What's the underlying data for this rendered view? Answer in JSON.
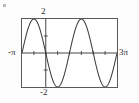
{
  "figure": {
    "title": "",
    "frame": {
      "border_color": "#5a5a5a",
      "background": "#ffffff"
    },
    "labels": {
      "y_max": "2",
      "y_min": "-2",
      "x_min": "-π",
      "x_max": "3π"
    }
  },
  "chart_data": {
    "type": "line",
    "title": "",
    "xlabel": "",
    "ylabel": "",
    "xlim": [
      -3.14159265,
      9.42477796
    ],
    "ylim": [
      -2,
      2
    ],
    "grid": false,
    "legend": null,
    "curve_color": "#3a3a3a",
    "axis_color": "#2b2b2b",
    "x_tick_labels": [
      "-π",
      "3π"
    ],
    "y_tick_labels": [
      "-2",
      "2"
    ],
    "x_ticks": [
      -3.14159265,
      -1.57079633,
      0,
      1.57079633,
      3.14159265,
      4.71238898,
      6.28318531,
      7.85398163,
      9.42477796
    ],
    "y_ticks": [
      -2,
      -1,
      0,
      1,
      2
    ],
    "series": [
      {
        "name": "y = -2 sin(x)",
        "amplitude": 2,
        "period": 6.28318531,
        "x": [
          -3.14159265,
          -2.74889357,
          -2.35619449,
          -1.96349541,
          -1.57079633,
          -1.17809725,
          -0.78539816,
          -0.39269908,
          0,
          0.39269908,
          0.78539816,
          1.17809725,
          1.57079633,
          1.96349541,
          2.35619449,
          2.74889357,
          3.14159265,
          3.53429174,
          3.92699082,
          4.3196899,
          4.71238898,
          5.10508806,
          5.49778714,
          5.89048623,
          6.28318531,
          6.67588438,
          7.06858347,
          7.46128255,
          7.85398163,
          8.24668072,
          8.6393798,
          9.03207888,
          9.42477796
        ],
        "y": [
          0,
          0.765,
          1.414,
          1.848,
          2,
          1.848,
          1.414,
          0.765,
          0,
          -0.765,
          -1.414,
          -1.848,
          -2,
          -1.848,
          -1.414,
          -0.765,
          0,
          0.765,
          1.414,
          1.848,
          2,
          1.848,
          1.414,
          0.765,
          0,
          -0.765,
          -1.414,
          -1.848,
          -2,
          -1.848,
          -1.414,
          -0.765,
          0
        ]
      }
    ]
  }
}
